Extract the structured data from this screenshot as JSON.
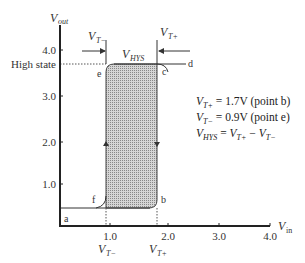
{
  "axes": {
    "y_label": "V",
    "y_label_sub": "out",
    "x_label": "V",
    "x_label_sub": "in",
    "y_ticks": [
      "4.0",
      "3.0",
      "2.0",
      "1.0"
    ],
    "x_ticks": [
      "1.0",
      "2.0",
      "3.0",
      "4.0"
    ],
    "high_state_label": "High state"
  },
  "points": {
    "a": "a",
    "b": "b",
    "c": "c",
    "d": "d",
    "e": "e",
    "f": "f"
  },
  "annotations": {
    "vt_minus_top": "V",
    "vt_minus_sub": "T−",
    "vt_plus_top": "V",
    "vt_plus_sub": "T+",
    "vhys": "V",
    "vhys_sub": "HYS",
    "vt_minus_bottom_sub": "T−",
    "vt_plus_bottom_sub": "T+"
  },
  "equations": {
    "line1": {
      "var": "V",
      "sub": "T+",
      "rest": " = 1.7V (point b)"
    },
    "line2": {
      "var": "V",
      "sub": "T−",
      "rest": " = 0.9V (point e)"
    },
    "line3": {
      "var": "V",
      "sub": "HYS",
      "eq": " = ",
      "a": "V",
      "a_sub": "T+",
      "minus": " − ",
      "b": "V",
      "b_sub": "T−"
    }
  },
  "colors": {
    "shade": "#9a9a9a",
    "line": "#333333"
  }
}
